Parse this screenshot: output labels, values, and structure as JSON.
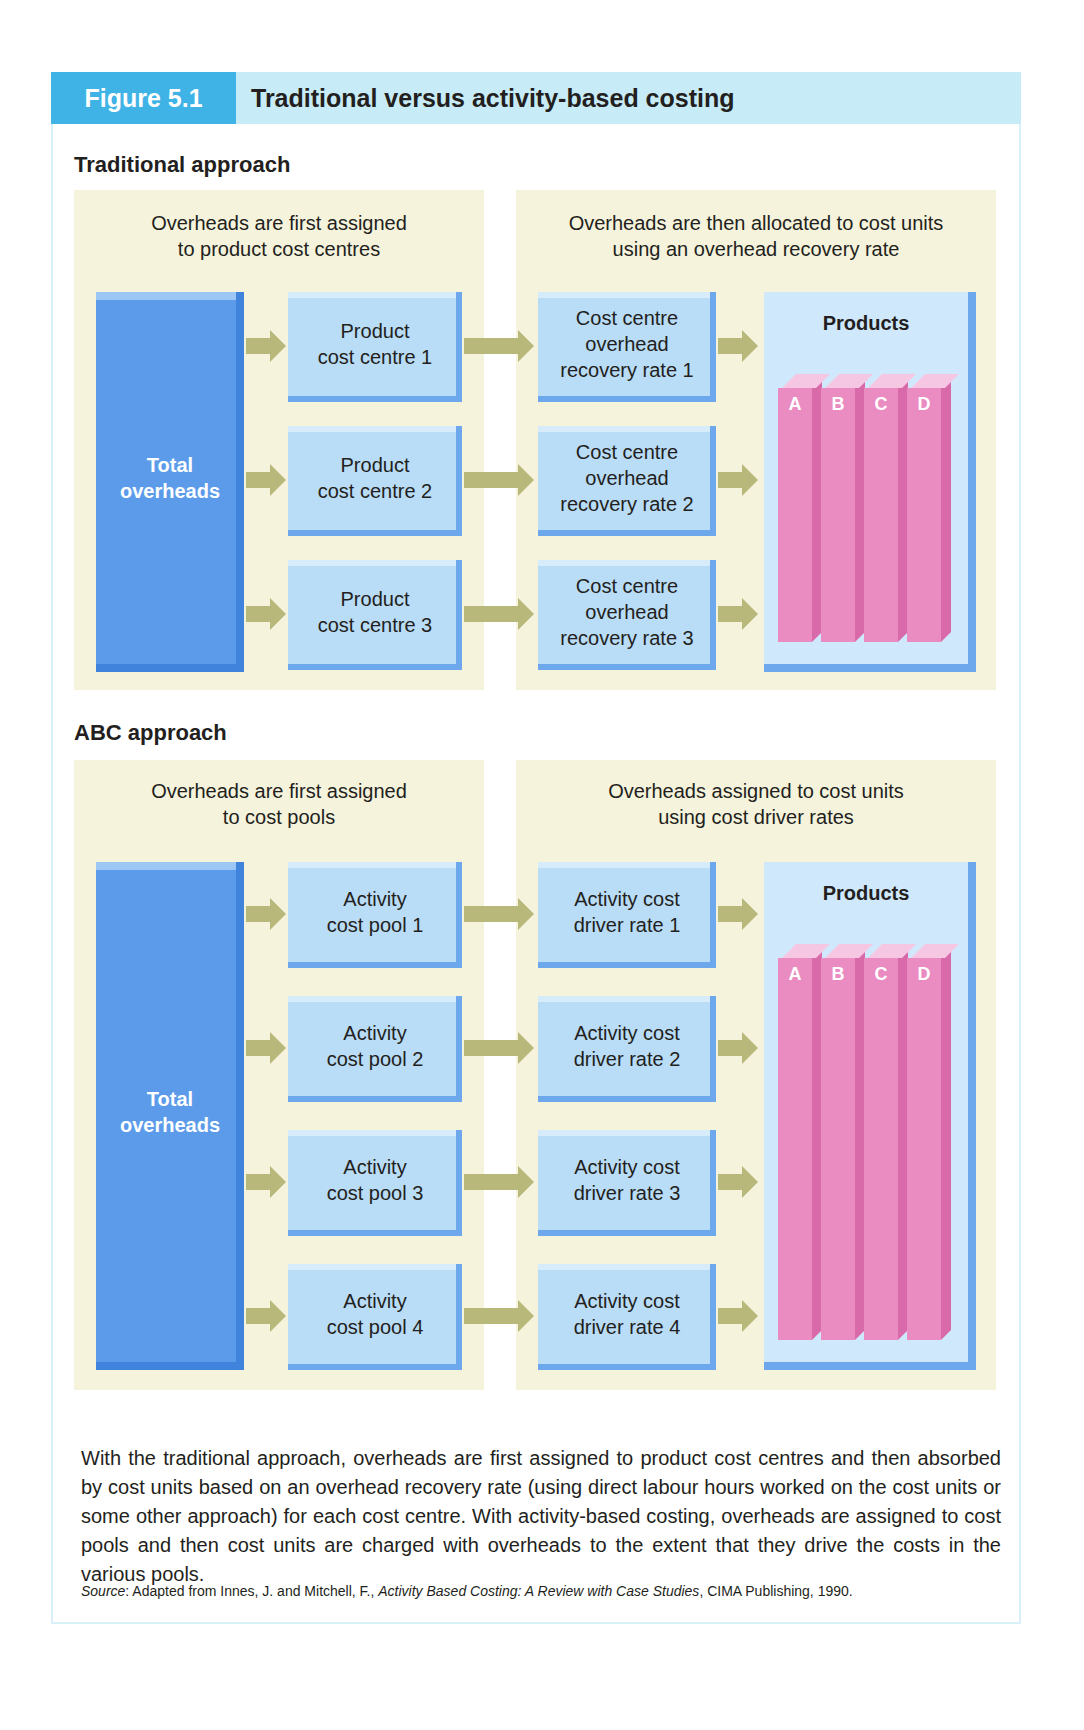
{
  "header": {
    "figure_number": "Figure 5.1",
    "title": "Traditional versus activity-based costing"
  },
  "traditional": {
    "section_title": "Traditional approach",
    "left_caption": "Overheads are first assigned\nto product cost centres",
    "right_caption": "Overheads are then allocated to cost units\nusing an overhead recovery rate",
    "total_label": "Total\noverheads",
    "stage1": [
      "Product\ncost centre 1",
      "Product\ncost centre 2",
      "Product\ncost centre 3"
    ],
    "stage2": [
      "Cost centre\noverhead\nrecovery rate 1",
      "Cost centre\noverhead\nrecovery rate 2",
      "Cost centre\noverhead\nrecovery rate 3"
    ],
    "products_label": "Products",
    "products": [
      "A",
      "B",
      "C",
      "D"
    ]
  },
  "abc": {
    "section_title": "ABC approach",
    "left_caption": "Overheads are first assigned\nto cost pools",
    "right_caption": "Overheads assigned to cost units\nusing cost driver rates",
    "total_label": "Total\noverheads",
    "stage1": [
      "Activity\ncost pool 1",
      "Activity\ncost pool 2",
      "Activity\ncost pool 3",
      "Activity\ncost pool 4"
    ],
    "stage2": [
      "Activity cost\ndriver rate 1",
      "Activity cost\ndriver rate 2",
      "Activity cost\ndriver rate 3",
      "Activity cost\ndriver rate 4"
    ],
    "products_label": "Products",
    "products": [
      "A",
      "B",
      "C",
      "D"
    ]
  },
  "description": "With the traditional approach, overheads are first assigned to product cost centres and then absorbed by cost units based on an overhead recovery rate (using direct labour hours worked on the cost units or some other approach) for each cost centre. With activity-based costing, overheads are assigned to cost pools and then cost units are charged with overheads to the extent that they drive the costs in the various pools.",
  "source": {
    "label": "Source",
    "prefix": ": Adapted from Innes, J. and Mitchell, F., ",
    "book_title": "Activity Based Costing: A Review with Case Studies",
    "suffix": ", CIMA Publishing, 1990."
  },
  "colors": {
    "figure_tag": "#3fb3e6",
    "header_band": "#c7ecf7",
    "panel_bg": "#f5f3dc",
    "box_fill": "#b9dcf7",
    "total_fill": "#5b9bea",
    "arrow": "#b8b87a",
    "product_bar": "#ea8cc2"
  }
}
